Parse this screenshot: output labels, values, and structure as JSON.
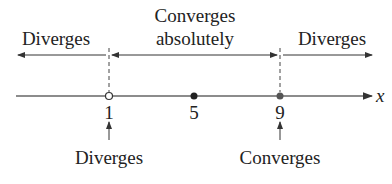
{
  "diagram": {
    "type": "number-line",
    "axis_label": "x",
    "ticks": [
      "1",
      "5",
      "9"
    ],
    "regions": [
      {
        "label": "Diverges"
      },
      {
        "label_line1": "Converges",
        "label_line2": "absolutely"
      },
      {
        "label": "Diverges"
      }
    ],
    "endpoints": [
      {
        "value": "1",
        "marker": "open",
        "note": "Diverges"
      },
      {
        "value": "5",
        "marker": "filled-center"
      },
      {
        "value": "9",
        "marker": "filled",
        "note": "Converges"
      }
    ]
  }
}
